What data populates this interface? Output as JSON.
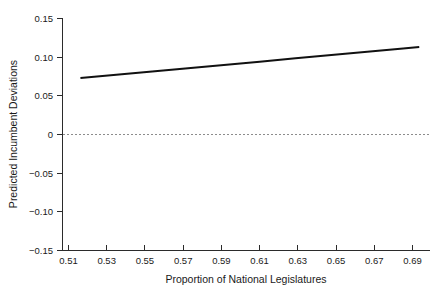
{
  "chart_data": {
    "type": "line",
    "title": "",
    "subtitle": "",
    "xlabel": "Proportion of National Legislatures",
    "ylabel": "Predicted Incumbent Deviations",
    "xlim": [
      0.5,
      0.705
    ],
    "ylim": [
      -0.15,
      0.15
    ],
    "xticks": [
      0.51,
      0.53,
      0.55,
      0.57,
      0.59,
      0.61,
      0.63,
      0.65,
      0.67,
      0.69
    ],
    "xtick_labels": [
      "0.51",
      "0.53",
      "0.55",
      "0.57",
      "0.59",
      "0.61",
      "0.63",
      "0.65",
      "0.67",
      "0.69"
    ],
    "yticks": [
      0.15,
      0.1,
      0.05,
      0,
      -0.05,
      -0.1,
      -0.15
    ],
    "ytick_labels": [
      "0.15",
      "0.10",
      "0.05",
      "0",
      "−0.05",
      "−0.10",
      "−0.15"
    ],
    "grid": false,
    "legend": null,
    "series": [
      {
        "name": "Predicted incumbent deviation",
        "style": "solid",
        "color": "#111111",
        "x": [
          0.51,
          0.53,
          0.55,
          0.57,
          0.59,
          0.61,
          0.63,
          0.65,
          0.67,
          0.69,
          0.699
        ],
        "values": [
          0.073,
          0.0772,
          0.0815,
          0.0857,
          0.09,
          0.0942,
          0.0985,
          0.1027,
          0.107,
          0.1112,
          0.1131
        ]
      },
      {
        "name": "zero reference",
        "style": "dashed",
        "color": "#8c8c8c",
        "x": [
          0.5,
          0.705
        ],
        "values": [
          0,
          0
        ]
      }
    ],
    "annotations": []
  },
  "axes": {
    "x_axis_label": "Proportion of National Legislatures",
    "y_axis_label": "Predicted Incumbent Deviations"
  }
}
